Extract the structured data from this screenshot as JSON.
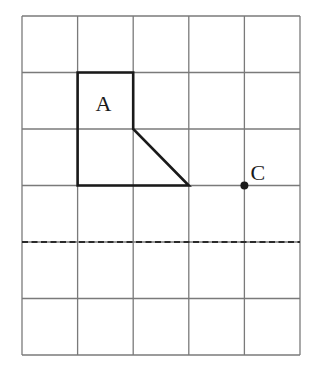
{
  "diagram": {
    "type": "grid-reflection-exercise",
    "grid": {
      "columns": 5,
      "rows": 6,
      "origin_px": [
        22,
        16
      ],
      "cell_width_px": 55.6,
      "cell_height_px": 56.5,
      "line_color": "#7a7a7a"
    },
    "shape": {
      "label": "A",
      "vertices_grid": [
        [
          1,
          1
        ],
        [
          2,
          1
        ],
        [
          2,
          2
        ],
        [
          3,
          3
        ],
        [
          1,
          3
        ]
      ],
      "stroke_color": "#1a1a1a"
    },
    "point": {
      "label": "C",
      "position_grid": [
        4,
        3
      ]
    },
    "mirror_line": {
      "style": "dashed",
      "orientation": "horizontal",
      "grid_row": 4
    }
  }
}
